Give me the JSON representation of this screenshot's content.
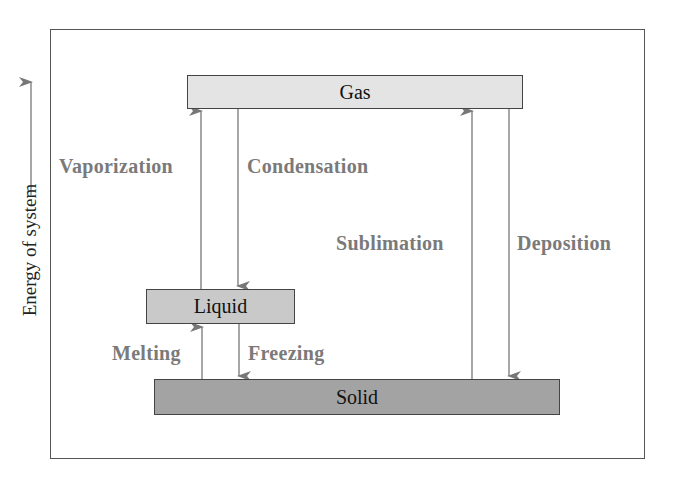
{
  "diagram": {
    "axis_label": "Energy of system",
    "states": {
      "gas": "Gas",
      "liquid": "Liquid",
      "solid": "Solid"
    },
    "transitions": {
      "vaporization": "Vaporization",
      "condensation": "Condensation",
      "melting": "Melting",
      "freezing": "Freezing",
      "sublimation": "Sublimation",
      "deposition": "Deposition"
    },
    "colors": {
      "gas_fill": "#e4e4e4",
      "liquid_fill": "#c9c9c9",
      "solid_fill": "#a3a3a3",
      "label_gray": "#7a7a7a",
      "arrow_gray": "#777777"
    }
  }
}
